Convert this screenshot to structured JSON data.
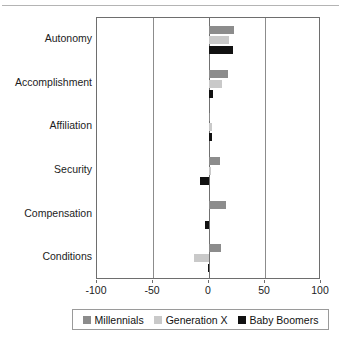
{
  "figure": {
    "has_top_rule": true,
    "background": "#ffffff"
  },
  "chart_data": {
    "type": "bar",
    "orientation": "horizontal",
    "title": "",
    "subtitle": "",
    "xlabel": "",
    "ylabel": "",
    "categories": [
      "Autonomy",
      "Accomplishment",
      "Affiliation",
      "Security",
      "Compensation",
      "Conditions"
    ],
    "series": [
      {
        "name": "Millennials",
        "color": "#8c8c8c",
        "values": [
          22,
          17,
          1,
          10,
          15,
          11
        ]
      },
      {
        "name": "Generation X",
        "color": "#c9c9c9",
        "values": [
          18,
          12,
          3,
          2,
          0,
          -13
        ]
      },
      {
        "name": "Baby Boomers",
        "color": "#111111",
        "values": [
          21,
          4,
          3,
          -8,
          -4,
          -1
        ]
      }
    ],
    "xlim": [
      -100,
      100
    ],
    "xticks": [
      -100,
      -50,
      0,
      50,
      100
    ],
    "xtick_labels": [
      "-100",
      "-50",
      "0",
      "50",
      "100"
    ],
    "gridlines": [
      -50,
      0,
      50
    ],
    "grid": true,
    "zero_line": 0,
    "legend_position": "bottom",
    "legend_entries": [
      "Millennials",
      "Generation X",
      "Baby Boomers"
    ]
  },
  "axis": {
    "tick_labels": [
      "-100",
      "-50",
      "0",
      "50",
      "100"
    ]
  },
  "legend": {
    "items": [
      {
        "label": "Millennials",
        "color": "#8c8c8c"
      },
      {
        "label": "Generation X",
        "color": "#c9c9c9"
      },
      {
        "label": "Baby Boomers",
        "color": "#111111"
      }
    ]
  }
}
